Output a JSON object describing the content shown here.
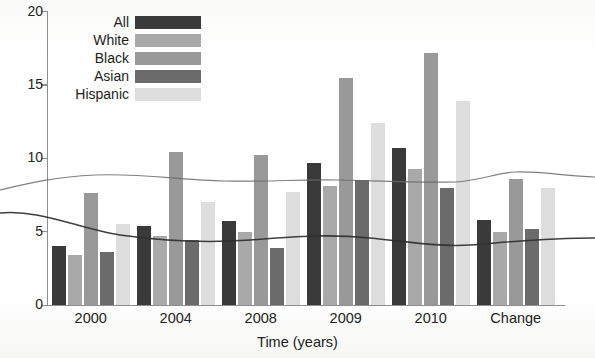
{
  "chart_data": {
    "type": "bar",
    "title": "",
    "xlabel": "Time (years)",
    "ylabel": "",
    "categories": [
      "2000",
      "2004",
      "2008",
      "2009",
      "2010",
      "Change"
    ],
    "series": [
      {
        "name": "All",
        "color": "#3a3a3a",
        "values": [
          4.0,
          5.4,
          5.7,
          9.7,
          10.7,
          5.8
        ]
      },
      {
        "name": "White",
        "color": "#a9a9a9",
        "values": [
          3.4,
          4.7,
          5.0,
          8.1,
          9.3,
          5.0
        ]
      },
      {
        "name": "Black",
        "color": "#999999",
        "values": [
          7.6,
          10.4,
          10.2,
          15.5,
          17.2,
          8.6
        ]
      },
      {
        "name": "Asian",
        "color": "#6b6b6b",
        "values": [
          3.6,
          4.4,
          3.9,
          8.5,
          8.0,
          5.2
        ]
      },
      {
        "name": "Hispanic",
        "color": "#dddddd",
        "values": [
          5.5,
          7.0,
          7.7,
          12.4,
          13.9,
          8.0
        ]
      }
    ],
    "ylim": [
      0,
      20
    ],
    "yticks": [
      0,
      5,
      10,
      15,
      20
    ],
    "ytick_labels": [
      "0",
      "5",
      "10",
      "15",
      "20"
    ],
    "grid": false,
    "legend_position": "top-left"
  },
  "axes": {
    "y_tick_labels": [
      "20",
      "15",
      "10",
      "5",
      "0"
    ],
    "x_tick_labels": [
      "2000",
      "2004",
      "2008",
      "2009",
      "2010",
      "Change"
    ],
    "x_axis_title": "Time (years)"
  },
  "legend": {
    "items": [
      {
        "label": "All",
        "color": "#3a3a3a"
      },
      {
        "label": "White",
        "color": "#a9a9a9"
      },
      {
        "label": "Black",
        "color": "#999999"
      },
      {
        "label": "Asian",
        "color": "#6b6b6b"
      },
      {
        "label": "Hispanic",
        "color": "#dddddd"
      }
    ]
  },
  "colors": {
    "axis": "#8e8e8e",
    "text": "#232323",
    "background": "#ffffff",
    "crease": "#5a5a5a"
  }
}
